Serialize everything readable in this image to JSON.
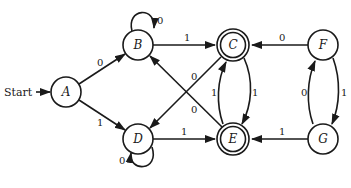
{
  "diagram": {
    "type": "finite-automaton",
    "start_label": "Start",
    "colors": {
      "stroke": "#1a1a1a",
      "background": "#ffffff"
    },
    "states": [
      {
        "id": "A",
        "label": "A",
        "x": 66,
        "y": 92,
        "accepting": false,
        "start": true
      },
      {
        "id": "B",
        "label": "B",
        "x": 138,
        "y": 45,
        "accepting": false,
        "start": false
      },
      {
        "id": "C",
        "label": "C",
        "x": 233,
        "y": 45,
        "accepting": true,
        "start": false
      },
      {
        "id": "D",
        "label": "D",
        "x": 138,
        "y": 139,
        "accepting": false,
        "start": false
      },
      {
        "id": "E",
        "label": "E",
        "x": 233,
        "y": 139,
        "accepting": true,
        "start": false
      },
      {
        "id": "F",
        "label": "F",
        "x": 323,
        "y": 45,
        "accepting": false,
        "start": false
      },
      {
        "id": "G",
        "label": "G",
        "x": 323,
        "y": 139,
        "accepting": false,
        "start": false
      }
    ],
    "transitions": [
      {
        "from": "A",
        "to": "B",
        "label": "0"
      },
      {
        "from": "A",
        "to": "D",
        "label": "1"
      },
      {
        "from": "B",
        "to": "B",
        "label": "0"
      },
      {
        "from": "B",
        "to": "C",
        "label": "1"
      },
      {
        "from": "C",
        "to": "D",
        "label": "0"
      },
      {
        "from": "E",
        "to": "B",
        "label": "0"
      },
      {
        "from": "D",
        "to": "D",
        "label": "0"
      },
      {
        "from": "D",
        "to": "E",
        "label": "1"
      },
      {
        "from": "C",
        "to": "E",
        "label": "1"
      },
      {
        "from": "E",
        "to": "C",
        "label": "1"
      },
      {
        "from": "F",
        "to": "C",
        "label": "0"
      },
      {
        "from": "G",
        "to": "E",
        "label": "1"
      },
      {
        "from": "F",
        "to": "G",
        "label": "1"
      },
      {
        "from": "G",
        "to": "F",
        "label": "0"
      }
    ]
  }
}
